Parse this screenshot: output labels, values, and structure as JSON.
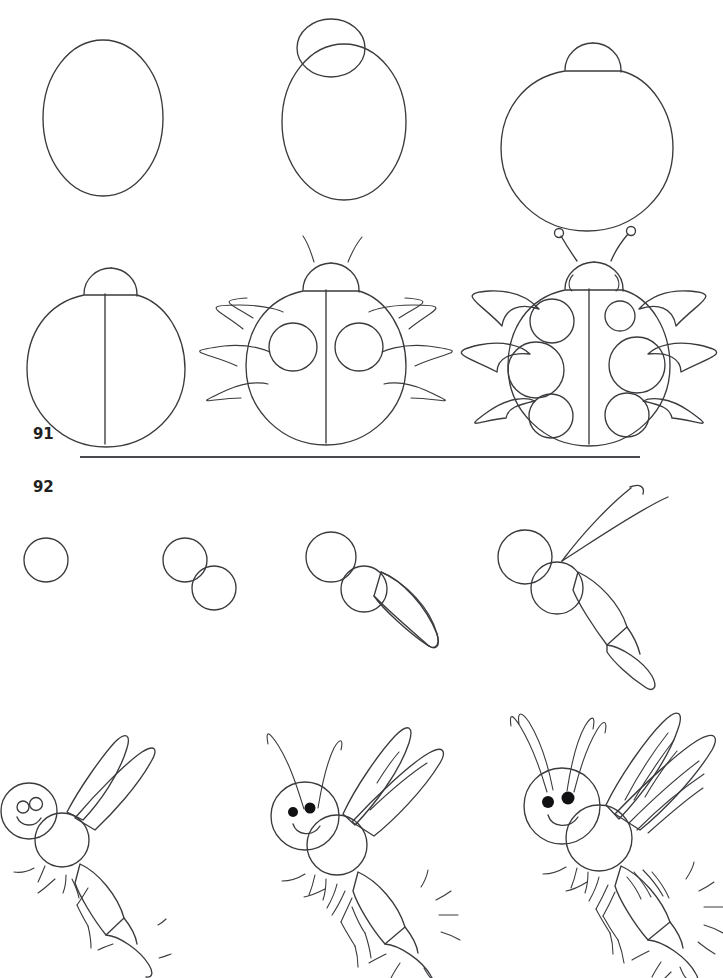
{
  "page": {
    "background_color": "#ffffff",
    "ink_color": "#3b3b3f",
    "label_color": "#231f20",
    "width": 723,
    "height": 978
  },
  "sections": [
    {
      "number": "91",
      "subject": "ladybug",
      "subject_label": "Ladybug",
      "step_count": 6,
      "steps": [
        {
          "index": 1,
          "caption": "Draw a large oval for the body."
        },
        {
          "index": 2,
          "caption": "Add a small circle overlapping the top for the head."
        },
        {
          "index": 3,
          "caption": "Erase the overlap so the head is a dome."
        },
        {
          "index": 4,
          "caption": "Draw a vertical line down the center of the body."
        },
        {
          "index": 5,
          "caption": "Add three curved legs per side, two antennae and two spots."
        },
        {
          "index": 6,
          "caption": "Finish with six spots, thick legs, eyes and ball-tipped antennae."
        }
      ]
    },
    {
      "number": "92",
      "subject": "dragonfly",
      "subject_label": "Dragonfly",
      "step_count": 7,
      "steps": [
        {
          "index": 1,
          "caption": "Draw a circle for the head."
        },
        {
          "index": 2,
          "caption": "Add a second circle below-right for the thorax."
        },
        {
          "index": 3,
          "caption": "Add a long tapered shape for the abdomen."
        },
        {
          "index": 4,
          "caption": "Segment the abdomen and sketch two wing guide lines."
        },
        {
          "index": 5,
          "caption": "Outline two wings, draw the face with eyes and a smile."
        },
        {
          "index": 6,
          "caption": "Add antennae, filled eyes, wing veins, legs and stinger rays."
        },
        {
          "index": 7,
          "caption": "Double the antennae, add full wing veins and abdomen stripes."
        }
      ]
    }
  ],
  "divider": {
    "name": "section-divider",
    "x1": 80,
    "x2": 640,
    "y": 457
  }
}
